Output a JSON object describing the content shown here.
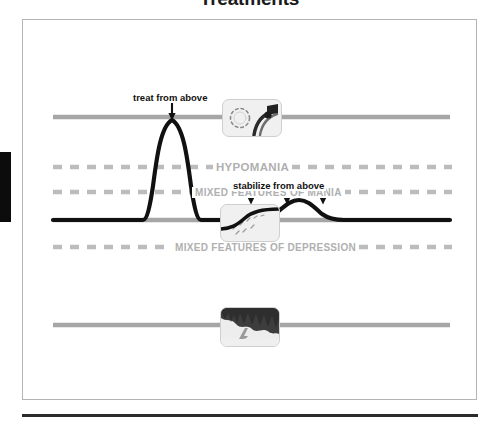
{
  "slide": {
    "title": "Treatments"
  },
  "diagram": {
    "zone_labels": {
      "hypomania": "HYPOMANIA",
      "mixed_features_mania": "MIXED FEATURES OF MANIA",
      "mixed_features_depression": "MIXED FEATURES OF DEPRESSION"
    },
    "annotations": {
      "treat_from_above": "treat from above",
      "stabilize_from_above": "stabilize from above"
    },
    "icons": {
      "sun_pill": "sun-and-pill-icon",
      "rising_curve": "rising-curve-icon",
      "storm_cloud": "storm-cloud-lightning-icon"
    },
    "colors": {
      "threshold_line": "#a6a6a6",
      "dashed_line": "#b9b9b9",
      "baseline": "#111111",
      "mood_curve": "#111111",
      "zone_label_text": "#b0b0b0",
      "annotation_text": "#111111",
      "frame_border": "#b4b4b4",
      "left_tab": "#0c0c0c",
      "bottom_rule": "#2b2b2b"
    },
    "lines": [
      {
        "name": "hypomania-threshold",
        "style": "solid",
        "y": 117
      },
      {
        "name": "mixed-mania-upper-dashed",
        "style": "dashed",
        "y": 167
      },
      {
        "name": "mixed-mania-lower-dashed",
        "style": "dashed",
        "y": 192
      },
      {
        "name": "euthymic-baseline",
        "style": "solid-black",
        "y": 220
      },
      {
        "name": "mixed-depression-dashed",
        "style": "dashed",
        "y": 247
      },
      {
        "name": "depression-threshold",
        "style": "solid",
        "y": 325
      }
    ],
    "arrows": {
      "treat_from_above_count": 1,
      "stabilize_from_above_count": 3
    }
  }
}
